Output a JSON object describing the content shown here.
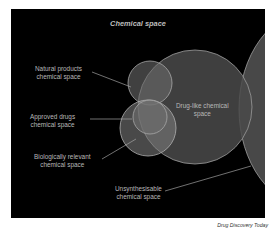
{
  "figure": {
    "title": "Chemical space",
    "caption": "Drug Discovery Today",
    "labels": {
      "natural_products": [
        "Natural products",
        "chemical space"
      ],
      "approved_drugs": [
        "Approved drugs",
        "chemical space"
      ],
      "drug_like": [
        "Drug-like chemical",
        "space"
      ],
      "biologically_relevant": [
        "Biologically relevant",
        "chemical space"
      ],
      "unsynthesisable": [
        "Unsynthesisable",
        "chemical space"
      ]
    },
    "colors": {
      "background": "#000000",
      "circle_fill": "#5a5a5a",
      "circle_stroke": "#9a9a9a",
      "text": "#b8b8b8"
    }
  }
}
